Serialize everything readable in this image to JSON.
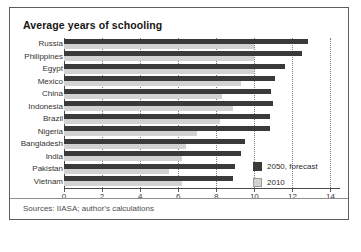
{
  "figure": {
    "title": "Average years of schooling",
    "sources": "Sources: IIASA; author's calculations"
  },
  "legend": {
    "items": [
      {
        "key": "forecast",
        "label": "2050, forecast",
        "color": "#3a3a3a"
      },
      {
        "key": "past",
        "label": "2010",
        "color": "#d2d2d2"
      }
    ]
  },
  "chart_data": {
    "type": "bar",
    "orientation": "horizontal",
    "title": "Average years of schooling",
    "xlabel": "",
    "ylabel": "",
    "xlim": [
      0,
      14.5
    ],
    "xticks": [
      0,
      2,
      4,
      6,
      8,
      10,
      12,
      14
    ],
    "xticklabels": [
      "0",
      "2",
      "4",
      "6",
      "8",
      "10",
      "12",
      "14"
    ],
    "grid": "vertical-dotted",
    "legend_position": "bottom-right",
    "categories": [
      "Russia",
      "Philippines",
      "Egypt",
      "Mexico",
      "China",
      "Indonesia",
      "Brazil",
      "Nigeria",
      "Bangladesh",
      "India",
      "Pakistan",
      "Vietnam"
    ],
    "series": [
      {
        "name": "2050, forecast",
        "color": "#3a3a3a",
        "values": [
          12.8,
          12.5,
          11.6,
          11.1,
          10.9,
          11.0,
          10.8,
          10.8,
          9.5,
          9.3,
          9.0,
          8.9
        ]
      },
      {
        "name": "2010",
        "color": "#d2d2d2",
        "values": [
          10.0,
          10.0,
          10.0,
          9.3,
          8.3,
          8.9,
          8.2,
          7.0,
          6.4,
          6.2,
          5.5,
          6.2
        ]
      }
    ]
  }
}
